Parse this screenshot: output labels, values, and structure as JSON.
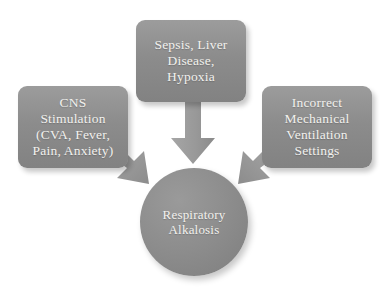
{
  "diagram": {
    "background_color": "#ffffff",
    "node_fill_color": "#8c8c8c",
    "arrow_fill_color": "#9a9a9a",
    "text_color": "#f2f1ee",
    "nodes": [
      {
        "id": "cns-stimulation",
        "label": "CNS\nStimulation\n(CVA, Fever,\nPain, Anxiety)",
        "shape": "rounded-rectangle",
        "position": "left"
      },
      {
        "id": "sepsis-liver-hypoxia",
        "label": "Sepsis, Liver\nDisease,\nHypoxia",
        "shape": "rounded-rectangle",
        "position": "top"
      },
      {
        "id": "incorrect-ventilation",
        "label": "Incorrect\nMechanical\nVentilation\nSettings",
        "shape": "rounded-rectangle",
        "position": "right"
      },
      {
        "id": "respiratory-alkalosis",
        "label": "Respiratory\nAlkalosis",
        "shape": "circle",
        "position": "center"
      }
    ],
    "arrows": [
      {
        "id": "arrow-top",
        "from": "sepsis-liver-hypoxia",
        "to": "respiratory-alkalosis",
        "direction": "down"
      },
      {
        "id": "arrow-left",
        "from": "cns-stimulation",
        "to": "respiratory-alkalosis",
        "direction": "down-right"
      },
      {
        "id": "arrow-right",
        "from": "incorrect-ventilation",
        "to": "respiratory-alkalosis",
        "direction": "down-left"
      }
    ]
  }
}
